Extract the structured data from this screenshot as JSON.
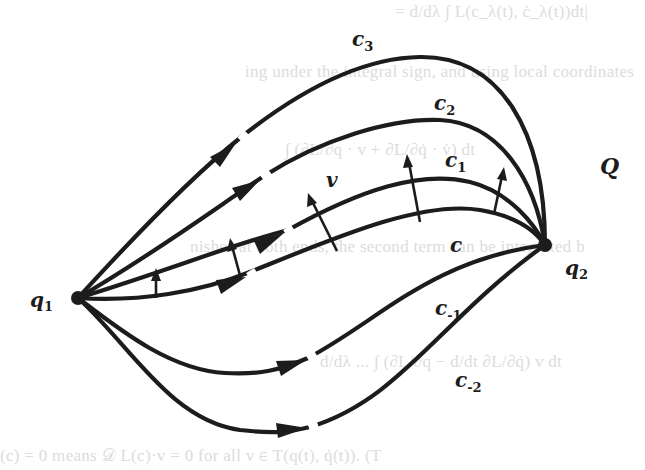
{
  "figure": {
    "manifold_label": "Q",
    "start_point": {
      "label": "q",
      "subscript": "1"
    },
    "end_point": {
      "label": "q",
      "subscript": "2"
    },
    "vector_field_label": "v",
    "curves": [
      {
        "id": "c3",
        "label": "c",
        "subscript": "3"
      },
      {
        "id": "c2",
        "label": "c",
        "subscript": "2"
      },
      {
        "id": "c1",
        "label": "c",
        "subscript": "1"
      },
      {
        "id": "c0",
        "label": "c",
        "subscript": ""
      },
      {
        "id": "cm1",
        "label": "c",
        "subscript": "-1"
      },
      {
        "id": "cm2",
        "label": "c",
        "subscript": "-2"
      }
    ]
  },
  "bleed_through_text": [
    "= d/dλ ∫ L(c_λ(t), ċ_λ(t))dt|",
    "ing under the integral sign, and using local coordinates",
    "∫ (∂L/∂q · v + ∂L/∂q̇ · v̇) dt",
    "nishes at both ends, the second term can be integrated b",
    "d/dλ ... ∫ (∂L/∂q − d/dt ∂L/∂q̇) v dt",
    "(c) = 0 means 𝒟 L(c)·v = 0 for all v ∈ T(q(t), q̇(t)). (T"
  ]
}
